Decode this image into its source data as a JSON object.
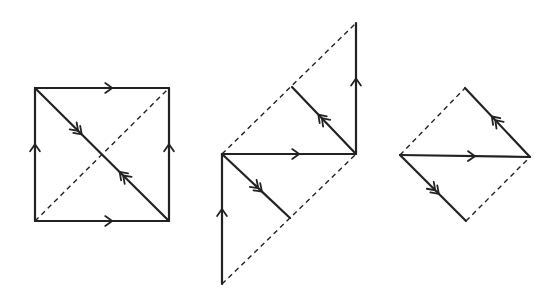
{
  "diagram": {
    "colors": {
      "line": "#222222",
      "background": "#ffffff"
    },
    "figures": [
      {
        "name": "square",
        "solid_edges": [
          {
            "from": [
              35,
              88
            ],
            "to": [
              169,
              88
            ],
            "arrow": "single",
            "dir": "right"
          },
          {
            "from": [
              35,
              221
            ],
            "to": [
              169,
              221
            ],
            "arrow": "single",
            "dir": "right"
          },
          {
            "from": [
              35,
              221
            ],
            "to": [
              35,
              88
            ],
            "arrow": "single",
            "dir": "up"
          },
          {
            "from": [
              169,
              221
            ],
            "to": [
              169,
              88
            ],
            "arrow": "single",
            "dir": "up"
          },
          {
            "from": [
              35,
              88
            ],
            "to": [
              169,
              221
            ],
            "arrow": "double",
            "dir": "mixed"
          }
        ],
        "dashed_edges": [
          {
            "from": [
              35,
              221
            ],
            "to": [
              169,
              88
            ]
          }
        ]
      },
      {
        "name": "parallelogram-cut",
        "solid_edges": [
          {
            "from": [
              222,
              284
            ],
            "to": [
              222,
              154
            ],
            "arrow": "single",
            "dir": "up"
          },
          {
            "from": [
              222,
              154
            ],
            "to": [
              356,
              154
            ],
            "arrow": "single",
            "dir": "right"
          },
          {
            "from": [
              356,
              154
            ],
            "to": [
              356,
              23
            ],
            "arrow": "single",
            "dir": "up"
          },
          {
            "from": [
              222,
              154
            ],
            "to": [
              290,
              218
            ],
            "arrow": "double",
            "dir": "down-right"
          },
          {
            "from": [
              356,
              154
            ],
            "to": [
              292,
              87
            ],
            "arrow": "double",
            "dir": "up-left"
          }
        ],
        "dashed_edges": [
          {
            "from": [
              222,
              154
            ],
            "to": [
              356,
              23
            ]
          },
          {
            "from": [
              222,
              284
            ],
            "to": [
              356,
              154
            ]
          }
        ]
      },
      {
        "name": "rhombus",
        "solid_edges": [
          {
            "from": [
              400,
              155
            ],
            "to": [
              530,
              157
            ],
            "arrow": "single",
            "dir": "right"
          },
          {
            "from": [
              530,
              157
            ],
            "to": [
              465,
              88
            ],
            "arrow": "double",
            "dir": "up-left"
          },
          {
            "from": [
              400,
              155
            ],
            "to": [
              466,
              221
            ],
            "arrow": "double",
            "dir": "down-right"
          }
        ],
        "dashed_edges": [
          {
            "from": [
              400,
              155
            ],
            "to": [
              465,
              88
            ]
          },
          {
            "from": [
              466,
              221
            ],
            "to": [
              530,
              157
            ]
          }
        ]
      }
    ]
  }
}
